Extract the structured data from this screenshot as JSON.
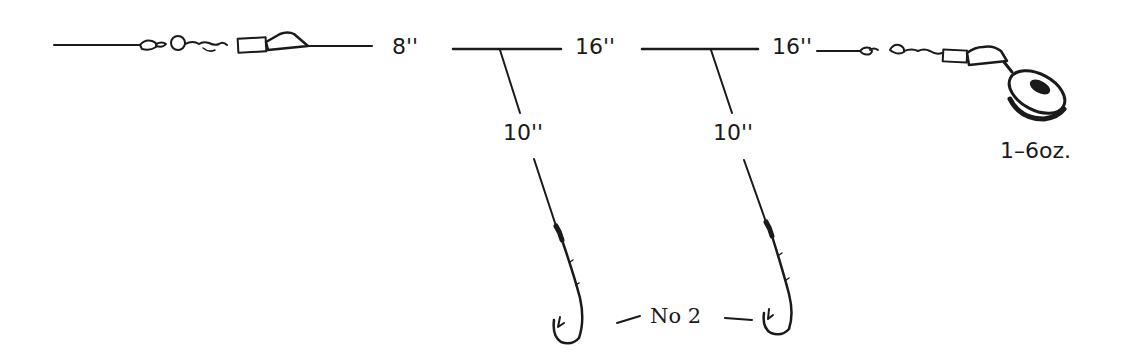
{
  "diagram": {
    "type": "fishing-rig-illustration",
    "labels": {
      "main_line_segment_1": "8''",
      "main_line_segment_2": "16''",
      "main_line_segment_3": "16''",
      "dropper_1": "10''",
      "dropper_2": "10''",
      "sinker_weight": "1–6oz.",
      "hook_size": "No 2"
    },
    "colors": {
      "ink": "#1a1a1a",
      "background": "#ffffff"
    }
  }
}
